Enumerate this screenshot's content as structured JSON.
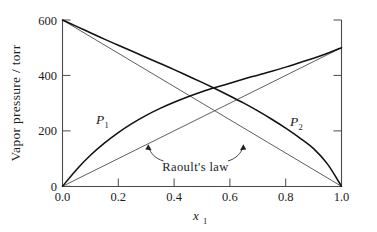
{
  "chart_data": {
    "type": "line",
    "title": "",
    "subtitle": "",
    "xlabel": "x₁",
    "xlabel_base": "x",
    "xlabel_sub": "1",
    "ylabel": "Vapor pressure / torr",
    "xlim": [
      0.0,
      1.0
    ],
    "ylim": [
      0,
      600
    ],
    "xticks": [
      0.0,
      0.2,
      0.4,
      0.6,
      0.8,
      1.0
    ],
    "xticklabels": [
      "0.0",
      "0.2",
      "0.4",
      "0.6",
      "0.8",
      "1.0"
    ],
    "yticks": [
      0,
      200,
      400,
      600
    ],
    "yticklabels": [
      "0",
      "200",
      "400",
      "600"
    ],
    "grid": false,
    "legend_position": "inline-annotation",
    "x": [
      0.0,
      0.05,
      0.1,
      0.15,
      0.2,
      0.25,
      0.3,
      0.35,
      0.4,
      0.45,
      0.5,
      0.55,
      0.6,
      0.65,
      0.7,
      0.75,
      0.8,
      0.85,
      0.9,
      0.95,
      1.0
    ],
    "series": [
      {
        "name": "P₁",
        "label_base": "P",
        "label_sub": "1",
        "style": "curve",
        "description": "Partial vapor pressure of component 1, positive deviation from Raoult's law",
        "values": [
          0,
          60,
          112,
          156,
          194,
          227,
          256,
          281,
          303,
          323,
          341,
          357,
          372,
          387,
          401,
          415,
          430,
          446,
          462,
          480,
          500
        ]
      },
      {
        "name": "P₂",
        "label_base": "P",
        "label_sub": "2",
        "style": "curve",
        "description": "Partial vapor pressure of component 2, positive deviation from Raoult's law",
        "values": [
          600,
          577,
          554,
          531,
          509,
          487,
          465,
          443,
          421,
          398,
          375,
          351,
          326,
          300,
          272,
          242,
          210,
          175,
          136,
          80,
          0
        ]
      },
      {
        "name": "Raoult's law (component 1)",
        "label": "Raoult's law",
        "style": "straight",
        "description": "Ideal straight line from 0 torr at x1=0 to 500 torr at x1=1",
        "values": [
          0,
          25,
          50,
          75,
          100,
          125,
          150,
          175,
          200,
          225,
          250,
          275,
          300,
          325,
          350,
          375,
          400,
          425,
          450,
          475,
          500
        ]
      },
      {
        "name": "Raoult's law (component 2)",
        "label": "Raoult's law",
        "style": "straight",
        "description": "Ideal straight line from 600 torr at x1=0 to 0 torr at x1=1",
        "values": [
          600,
          570,
          540,
          510,
          480,
          450,
          420,
          390,
          360,
          330,
          300,
          270,
          240,
          210,
          180,
          150,
          120,
          90,
          60,
          30,
          0
        ]
      }
    ],
    "annotations": [
      {
        "text": "Raoult's law",
        "x": 0.52,
        "y": 95,
        "arrows": [
          {
            "points_to_x": 0.32,
            "points_to_y": 160,
            "direction": "up-left"
          },
          {
            "points_to_x": 0.72,
            "points_to_y": 168,
            "direction": "up-right"
          }
        ]
      }
    ],
    "series_labels": [
      {
        "text": "P₁",
        "base": "P",
        "sub": "1",
        "x": 0.165,
        "y": 248
      },
      {
        "text": "P₂",
        "base": "P",
        "sub": "2",
        "x": 0.795,
        "y": 243
      }
    ]
  },
  "colors": {
    "curve": "#111111",
    "raoult": "#555555",
    "axis": "#4a4a4a",
    "text": "#1a1a1a",
    "background": "#ffffff"
  }
}
